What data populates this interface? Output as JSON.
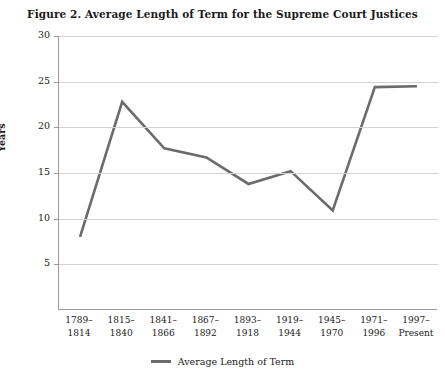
{
  "chart_data": {
    "type": "line",
    "title": "Figure 2.  Average Length of Term for the Supreme Court Justices",
    "xlabel": "",
    "ylabel": "Years",
    "ylim": [
      0,
      30
    ],
    "yticks": [
      30,
      25,
      20,
      15,
      10,
      5
    ],
    "grid": true,
    "legend_position": "bottom",
    "categories": [
      "1789–\n1814",
      "1815–\n1840",
      "1841–\n1866",
      "1867–\n1892",
      "1893–\n1918",
      "1919–\n1944",
      "1945–\n1970",
      "1971–\n1996",
      "1997–\nPresent"
    ],
    "category_lines": [
      [
        "1789–",
        "1814"
      ],
      [
        "1815–",
        "1840"
      ],
      [
        "1841–",
        "1866"
      ],
      [
        "1867–",
        "1892"
      ],
      [
        "1893–",
        "1918"
      ],
      [
        "1919–",
        "1944"
      ],
      [
        "1945–",
        "1970"
      ],
      [
        "1971–",
        "1996"
      ],
      [
        "1997–",
        "Present"
      ]
    ],
    "series": [
      {
        "name": "Average Length of Term",
        "color": "#6b6b6b",
        "values": [
          8.0,
          22.8,
          17.7,
          16.7,
          13.8,
          15.2,
          10.9,
          24.4,
          24.5
        ]
      }
    ]
  },
  "legend": {
    "label": "Average Length of Term"
  },
  "colors": {
    "line": "#6b6b6b",
    "grid": "#d3d3d3",
    "axis": "#9a9a9a",
    "text": "#1a1a1a",
    "background": "#ffffff"
  }
}
